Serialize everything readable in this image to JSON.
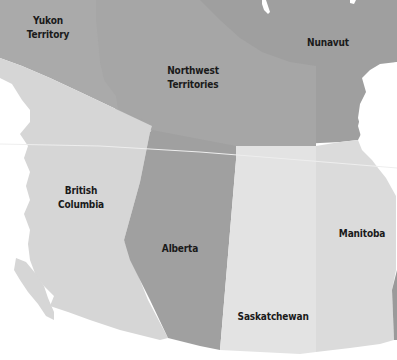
{
  "map": {
    "title": "Western and Northern Canada provinces and territories",
    "colors": {
      "background": "#ffffff",
      "yukon": "#a9a9a9",
      "northwest_territories": "#a3a3a3",
      "nunavut": "#9f9f9f",
      "british_columbia": "#d6d6d6",
      "alberta": "#a0a0a0",
      "saskatchewan": "#e3e3e3",
      "manitoba": "#dbdbdb",
      "ontario_edge": "#9a9a9a",
      "border_line": "#eeeeee",
      "label_text": "#1a1a1a"
    },
    "regions": [
      {
        "id": "yukon",
        "name_line1": "Yukon",
        "name_line2": "Territory"
      },
      {
        "id": "northwest_territories",
        "name_line1": "Northwest",
        "name_line2": "Territories"
      },
      {
        "id": "nunavut",
        "name_line1": "Nunavut",
        "name_line2": ""
      },
      {
        "id": "british_columbia",
        "name_line1": "British",
        "name_line2": "Columbia"
      },
      {
        "id": "alberta",
        "name_line1": "Alberta",
        "name_line2": ""
      },
      {
        "id": "saskatchewan",
        "name_line1": "Saskatchewan",
        "name_line2": ""
      },
      {
        "id": "manitoba",
        "name_line1": "Manitoba",
        "name_line2": ""
      }
    ]
  }
}
